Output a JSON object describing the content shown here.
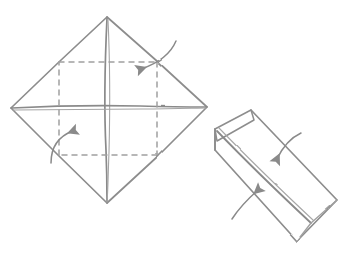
{
  "document": {
    "type": "origami-fold-diagram",
    "title": "Origami folding step: square folded to strip",
    "background_color": "#ffffff",
    "width": 350,
    "height": 255
  },
  "style": {
    "ink_color": "#8d8d8d",
    "ink_color_dark": "#7a7a7a",
    "ink_color_light": "#a8a8a8",
    "dash_color": "#a0a0a0",
    "arrow_color": "#8a8a8a",
    "stroke_width": 1.6,
    "dash_pattern": "5 5"
  },
  "figures": [
    {
      "id": "figure-left",
      "name": "square-diamond-with-fold-lines",
      "label": "",
      "shape": "diamond",
      "vertices": {
        "top": [
          107,
          17
        ],
        "right": [
          207,
          107
        ],
        "bottom": [
          107,
          203
        ],
        "left": [
          11,
          108
        ]
      },
      "creases": [
        {
          "name": "vertical-diagonal",
          "style": "solid",
          "from": [
            107,
            17
          ],
          "to": [
            107,
            203
          ]
        },
        {
          "name": "horizontal-diagonal",
          "style": "solid",
          "from": [
            11,
            108
          ],
          "to": [
            207,
            107
          ]
        },
        {
          "name": "midpoint-fold-upper-left",
          "style": "dashed",
          "from": [
            59,
            62
          ],
          "to": [
            157,
            62
          ]
        },
        {
          "name": "midpoint-fold-upper-right",
          "style": "dashed",
          "from": [
            157,
            62
          ],
          "to": [
            157,
            155
          ]
        },
        {
          "name": "midpoint-fold-lower-right",
          "style": "dashed",
          "from": [
            157,
            155
          ],
          "to": [
            59,
            155
          ]
        },
        {
          "name": "midpoint-fold-lower-left",
          "style": "dashed",
          "from": [
            59,
            155
          ],
          "to": [
            59,
            62
          ]
        }
      ],
      "arrows": [
        {
          "name": "fold-arrow-upper-right",
          "direction": "down-left",
          "from": [
            176,
            41
          ],
          "control": [
            168,
            60
          ],
          "to": [
            141,
            69
          ]
        },
        {
          "name": "fold-arrow-lower-left",
          "direction": "up-right",
          "from": [
            51,
            163
          ],
          "control": [
            51,
            139
          ],
          "to": [
            73,
            131
          ]
        }
      ]
    },
    {
      "id": "figure-right",
      "name": "folded-strip-parallelogram",
      "label": "",
      "shape": "parallelogram-rotated",
      "rotation_deg": 41,
      "vertices": {
        "top": [
          251,
          110
        ],
        "right": [
          337,
          200
        ],
        "bottom": [
          297,
          241
        ],
        "left": [
          215,
          150
        ]
      },
      "center_crease": {
        "name": "center-fold-line",
        "style": "solid",
        "from": [
          217,
          128
        ],
        "to": [
          310,
          221
        ]
      },
      "flap_edge": {
        "name": "upper-flap-edge",
        "style": "solid",
        "from": [
          215,
          130
        ],
        "to": [
          251,
          110
        ]
      },
      "arrows": [
        {
          "name": "fold-arrow-upper-strip",
          "direction": "down-left",
          "from": [
            301,
            133
          ],
          "control": [
            286,
            140
          ],
          "to": [
            277,
            159
          ]
        },
        {
          "name": "fold-arrow-lower-strip",
          "direction": "up-right",
          "from": [
            232,
            219
          ],
          "control": [
            241,
            205
          ],
          "to": [
            258,
            190
          ]
        }
      ]
    }
  ],
  "legend": {
    "solid_line_meaning": "edge or existing fold",
    "dashed_line_meaning": "valley fold line",
    "arrow_meaning": "fold direction"
  }
}
